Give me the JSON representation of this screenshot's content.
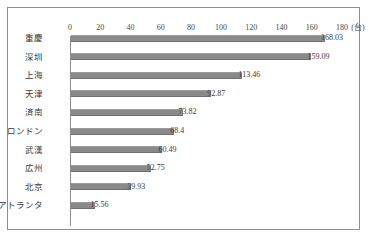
{
  "chart_data": {
    "type": "bar",
    "orientation": "horizontal",
    "title": "",
    "xlabel": "",
    "ylabel": "",
    "unit": "(台)",
    "xlim": [
      0,
      180
    ],
    "xticks": [
      0,
      20,
      40,
      60,
      80,
      100,
      120,
      140,
      160,
      180
    ],
    "xtick_labels": [
      "0",
      "20",
      "40",
      "60",
      "80",
      "100",
      "120",
      "140",
      "160",
      "180"
    ],
    "grid": false,
    "legend": null,
    "bar_color": "#8a8a8a",
    "frame_color": "#8d8d8d",
    "categories": [
      "重慶",
      "深圳",
      "上海",
      "天津",
      "済南",
      "ロンドン",
      "武漢",
      "広州",
      "北京",
      "アトランタ"
    ],
    "values": [
      168.03,
      159.09,
      113.46,
      92.87,
      73.82,
      68.4,
      60.49,
      52.75,
      39.93,
      15.56
    ],
    "value_labels": [
      "168.03",
      "159.09",
      "113.46",
      "92.87",
      "73.82",
      "68.4",
      "60.49",
      "52.75",
      "39.93",
      "15.56"
    ]
  }
}
